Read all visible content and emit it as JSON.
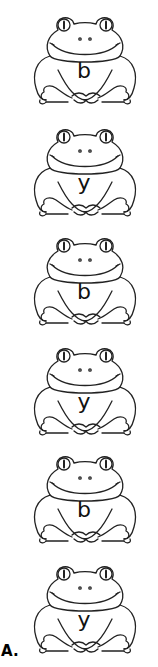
{
  "worksheet": {
    "frogs": [
      {
        "letter": "b",
        "top": 8
      },
      {
        "letter": "y",
        "top": 120
      },
      {
        "letter": "b",
        "top": 229
      },
      {
        "letter": "y",
        "top": 339
      },
      {
        "letter": "b",
        "top": 447
      },
      {
        "letter": "y",
        "top": 557
      }
    ],
    "label": "A."
  }
}
